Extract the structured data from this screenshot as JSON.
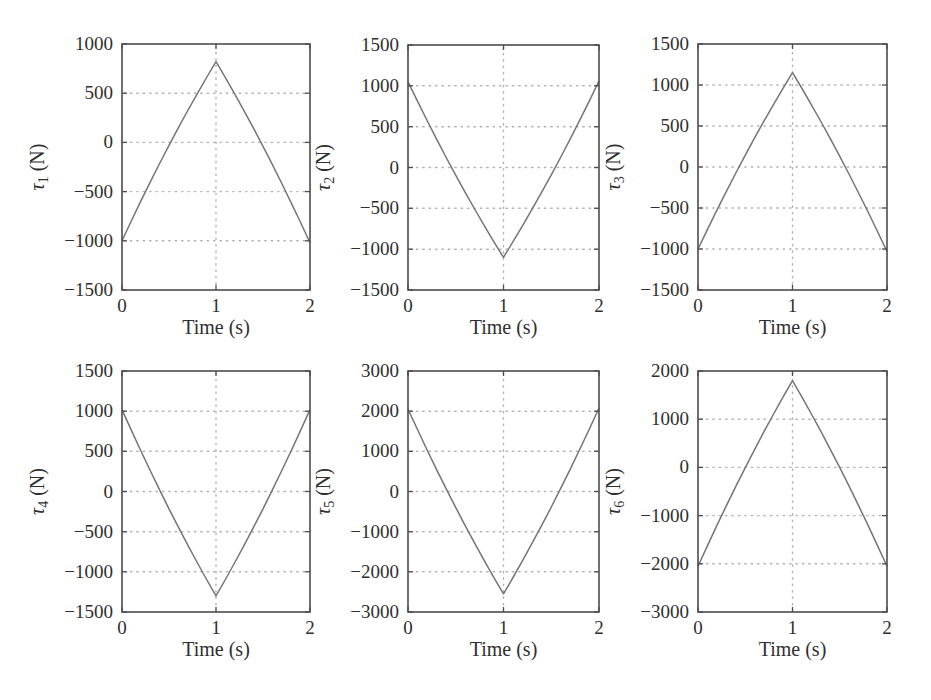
{
  "figure": {
    "background": "#ffffff",
    "style": {
      "line_color": "#757575",
      "axis_color": "#4d4d4d",
      "grid_color": "#b3b3b3",
      "text_color": "#2f2f2f"
    }
  },
  "chart_data": [
    {
      "id": "tau1",
      "type": "line",
      "title": "",
      "ylabel": "τ1 (N)",
      "ylabel_parts": {
        "symbol": "τ",
        "subscript": "1",
        "unit": "(N)"
      },
      "xlabel": "Time (s)",
      "grid": true,
      "legend": "none",
      "xlim": [
        0,
        2
      ],
      "xticks": [
        0,
        1,
        2
      ],
      "ylim": [
        -1500,
        1000
      ],
      "yticks": [
        1000,
        500,
        0,
        -500,
        -1000,
        -1500
      ],
      "x": [
        0,
        0.1,
        0.2,
        0.3,
        0.4,
        0.5,
        0.6,
        0.7,
        0.8,
        0.9,
        1.0,
        1.1,
        1.2,
        1.3,
        1.4,
        1.5,
        1.6,
        1.7,
        1.8,
        1.9,
        2.0
      ],
      "y": [
        -1000,
        -796,
        -598,
        -404,
        -214,
        -30,
        150,
        324,
        494,
        660,
        820,
        658,
        490,
        318,
        142,
        -40,
        -226,
        -418,
        -614,
        -814,
        -1020
      ]
    },
    {
      "id": "tau2",
      "type": "line",
      "title": "",
      "ylabel": "τ2 (N)",
      "ylabel_parts": {
        "symbol": "τ",
        "subscript": "2",
        "unit": "(N)"
      },
      "xlabel": "Time (s)",
      "grid": true,
      "legend": "none",
      "xlim": [
        0,
        2
      ],
      "xticks": [
        0,
        1,
        2
      ],
      "ylim": [
        -1500,
        1500
      ],
      "yticks": [
        1500,
        1000,
        500,
        0,
        -500,
        -1000,
        -1500
      ],
      "x": [
        0,
        0.1,
        0.2,
        0.3,
        0.4,
        0.5,
        0.6,
        0.7,
        0.8,
        0.9,
        1.0,
        1.1,
        1.2,
        1.3,
        1.4,
        1.5,
        1.6,
        1.7,
        1.8,
        1.9,
        2.0
      ],
      "y": [
        1050,
        810,
        575,
        346,
        123,
        -95,
        -307,
        -514,
        -715,
        -910,
        -1100,
        -909,
        -713,
        -511,
        -303,
        -90,
        129,
        353,
        583,
        819,
        1060
      ]
    },
    {
      "id": "tau3",
      "type": "line",
      "title": "",
      "ylabel": "τ3 (N)",
      "ylabel_parts": {
        "symbol": "τ",
        "subscript": "3",
        "unit": "(N)"
      },
      "xlabel": "Time (s)",
      "grid": true,
      "legend": "none",
      "xlim": [
        0,
        2
      ],
      "xticks": [
        0,
        1,
        2
      ],
      "ylim": [
        -1500,
        1500
      ],
      "yticks": [
        1500,
        1000,
        500,
        0,
        -500,
        -1000,
        -1500
      ],
      "x": [
        0,
        0.1,
        0.2,
        0.3,
        0.4,
        0.5,
        0.6,
        0.7,
        0.8,
        0.9,
        1.0,
        1.1,
        1.2,
        1.3,
        1.4,
        1.5,
        1.6,
        1.7,
        1.8,
        1.9,
        2.0
      ],
      "y": [
        -1000,
        -760,
        -525,
        -296,
        -73,
        145,
        357,
        564,
        765,
        960,
        1150,
        957,
        759,
        555,
        345,
        130,
        -91,
        -317,
        -549,
        -787,
        -1030
      ]
    },
    {
      "id": "tau4",
      "type": "line",
      "title": "",
      "ylabel": "τ4 (N)",
      "ylabel_parts": {
        "symbol": "τ",
        "subscript": "4",
        "unit": "(N)"
      },
      "xlabel": "Time (s)",
      "grid": true,
      "legend": "none",
      "xlim": [
        0,
        2
      ],
      "xticks": [
        0,
        1,
        2
      ],
      "ylim": [
        -1500,
        1500
      ],
      "yticks": [
        1500,
        1000,
        500,
        0,
        -500,
        -1000,
        -1500
      ],
      "x": [
        0,
        0.1,
        0.2,
        0.3,
        0.4,
        0.5,
        0.6,
        0.7,
        0.8,
        0.9,
        1.0,
        1.1,
        1.2,
        1.3,
        1.4,
        1.5,
        1.6,
        1.7,
        1.8,
        1.9,
        2.0
      ],
      "y": [
        1020,
        761,
        508,
        261,
        20,
        -215,
        -444,
        -667,
        -884,
        -1095,
        -1300,
        -1095,
        -884,
        -667,
        -444,
        -215,
        20,
        261,
        508,
        761,
        1020
      ]
    },
    {
      "id": "tau5",
      "type": "line",
      "title": "",
      "ylabel": "τ5 (N)",
      "ylabel_parts": {
        "symbol": "τ",
        "subscript": "5",
        "unit": "(N)"
      },
      "xlabel": "Time (s)",
      "grid": true,
      "legend": "none",
      "xlim": [
        0,
        2
      ],
      "xticks": [
        0,
        1,
        2
      ],
      "ylim": [
        -3000,
        3000
      ],
      "yticks": [
        3000,
        2000,
        1000,
        0,
        -1000,
        -2000,
        -3000
      ],
      "x": [
        0,
        0.1,
        0.2,
        0.3,
        0.4,
        0.5,
        0.6,
        0.7,
        0.8,
        0.9,
        1.0,
        1.1,
        1.2,
        1.3,
        1.4,
        1.5,
        1.6,
        1.7,
        1.8,
        1.9,
        2.0
      ],
      "y": [
        2050,
        1536,
        1034,
        544,
        66,
        -400,
        -854,
        -1296,
        -1726,
        -2144,
        -2550,
        -2141,
        -1720,
        -1287,
        -842,
        -385,
        84,
        565,
        1058,
        1563,
        2080
      ]
    },
    {
      "id": "tau6",
      "type": "line",
      "title": "",
      "ylabel": "τ6 (N)",
      "ylabel_parts": {
        "symbol": "τ",
        "subscript": "6",
        "unit": "(N)"
      },
      "xlabel": "Time (s)",
      "grid": true,
      "legend": "none",
      "xlim": [
        0,
        2
      ],
      "xticks": [
        0,
        1,
        2
      ],
      "ylim": [
        -3000,
        2000
      ],
      "yticks": [
        2000,
        1000,
        0,
        -1000,
        -2000,
        -3000
      ],
      "x": [
        0,
        0.1,
        0.2,
        0.3,
        0.4,
        0.5,
        0.6,
        0.7,
        0.8,
        0.9,
        1.0,
        1.1,
        1.2,
        1.3,
        1.4,
        1.5,
        1.6,
        1.7,
        1.8,
        1.9,
        2.0
      ],
      "y": [
        -2050,
        -1622,
        -1203,
        -794,
        -395,
        -5,
        375,
        746,
        1107,
        1458,
        1800,
        1458,
        1107,
        746,
        375,
        -5,
        -395,
        -794,
        -1203,
        -1622,
        -2050
      ]
    }
  ]
}
